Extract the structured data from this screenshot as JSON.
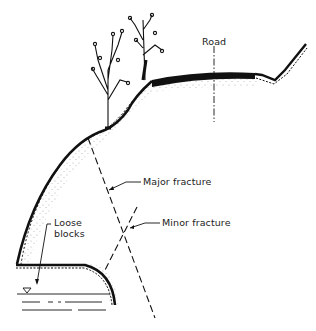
{
  "diagram": {
    "type": "geological cross-section of rock slope",
    "labels": {
      "road": "Road",
      "major_fracture": "Major fracture",
      "minor_fracture": "Minor fracture",
      "loose_blocks_line1": "Loose",
      "loose_blocks_line2": "blocks"
    },
    "symbols": {
      "water_level": "water-table-triangle-icon",
      "trees": "tree-icon"
    },
    "colors": {
      "ink": "#111111",
      "background": "#ffffff",
      "stipple": "#555555"
    }
  }
}
